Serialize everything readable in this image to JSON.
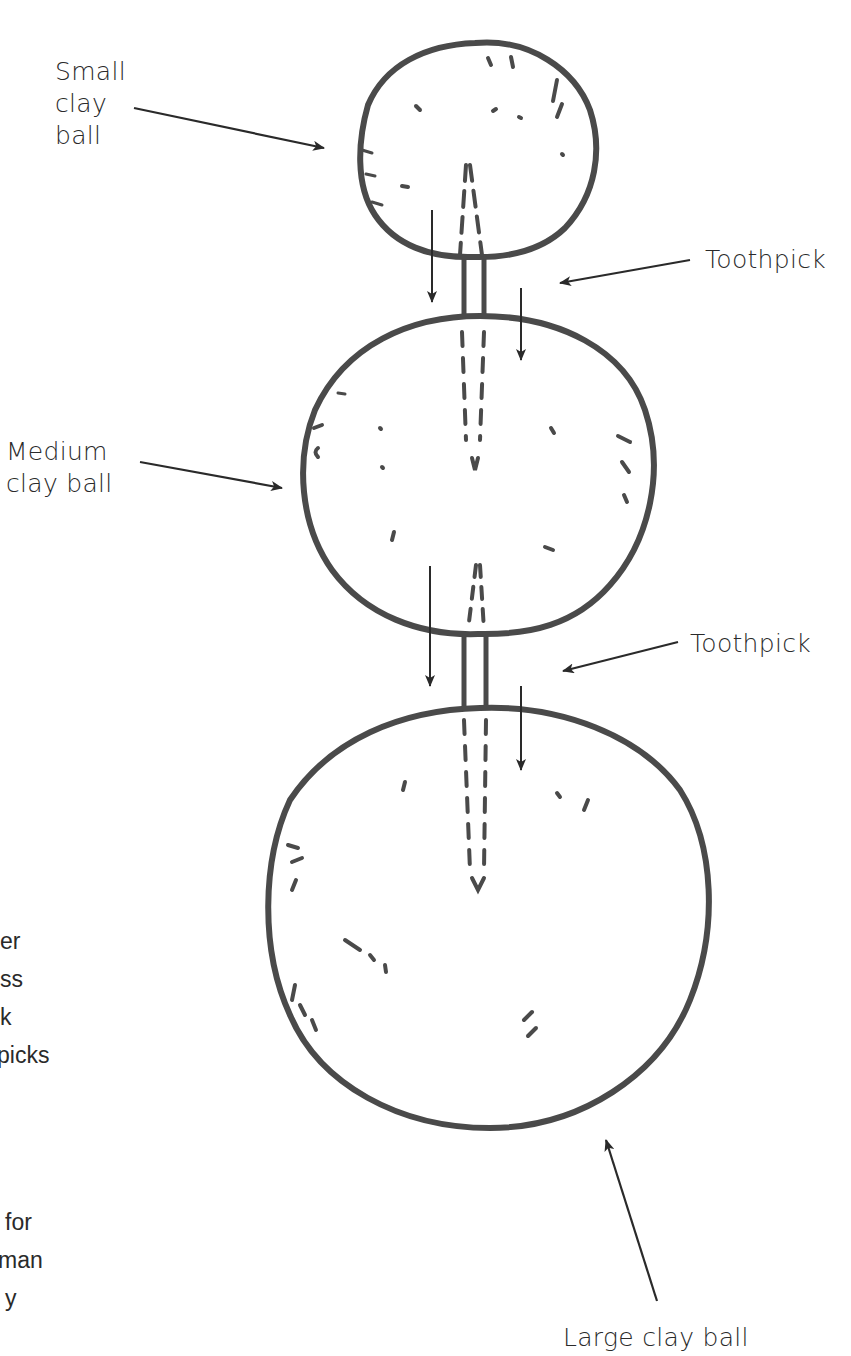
{
  "labels": {
    "small_ball": [
      "Small",
      "clay",
      "ball"
    ],
    "toothpick_top": "Toothpick",
    "medium_ball": [
      "Medium",
      "clay ball"
    ],
    "toothpick_bottom": "Toothpick",
    "large_ball": "Large clay ball"
  },
  "cropped_left_text": {
    "block1": [
      "er",
      "ss",
      "k",
      "picks"
    ],
    "block2": [
      "for",
      "man",
      "y"
    ]
  },
  "colors": {
    "ink": "#4a4a4a",
    "text": "#2a2a2a",
    "background": "#ffffff"
  }
}
